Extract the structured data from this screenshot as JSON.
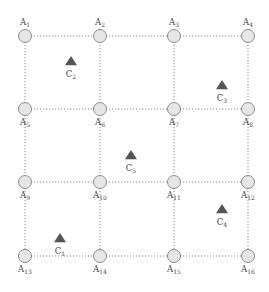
{
  "diagram": {
    "type": "grid-network",
    "grid": {
      "columns": 4,
      "rows": 4,
      "x": [
        25,
        100,
        174,
        248
      ],
      "y": [
        36,
        109,
        182,
        256
      ],
      "node_radius": 6.5
    },
    "colors": {
      "node_fill": "#e6e6e6",
      "node_stroke": "#8c8c8c",
      "edge": "#8a8a8a",
      "marker": "#555555",
      "label": "#444444"
    },
    "nodes": [
      {
        "id": "A1",
        "base": "A",
        "sub": "1",
        "col": 0,
        "row": 0,
        "label_pos": "above"
      },
      {
        "id": "A2",
        "base": "A",
        "sub": "2",
        "col": 1,
        "row": 0,
        "label_pos": "above"
      },
      {
        "id": "A3",
        "base": "A",
        "sub": "3",
        "col": 2,
        "row": 0,
        "label_pos": "above"
      },
      {
        "id": "A4",
        "base": "A",
        "sub": "4",
        "col": 3,
        "row": 0,
        "label_pos": "above"
      },
      {
        "id": "A5",
        "base": "A",
        "sub": "5",
        "col": 0,
        "row": 1,
        "label_pos": "below"
      },
      {
        "id": "A6",
        "base": "A",
        "sub": "6",
        "col": 1,
        "row": 1,
        "label_pos": "below"
      },
      {
        "id": "A7",
        "base": "A",
        "sub": "7",
        "col": 2,
        "row": 1,
        "label_pos": "below"
      },
      {
        "id": "A8",
        "base": "A",
        "sub": "8",
        "col": 3,
        "row": 1,
        "label_pos": "below"
      },
      {
        "id": "A9",
        "base": "A",
        "sub": "9",
        "col": 0,
        "row": 2,
        "label_pos": "below"
      },
      {
        "id": "A10",
        "base": "A",
        "sub": "10",
        "col": 1,
        "row": 2,
        "label_pos": "below"
      },
      {
        "id": "A11",
        "base": "A",
        "sub": "11",
        "col": 2,
        "row": 2,
        "label_pos": "below"
      },
      {
        "id": "A12",
        "base": "A",
        "sub": "12",
        "col": 3,
        "row": 2,
        "label_pos": "below"
      },
      {
        "id": "A13",
        "base": "A",
        "sub": "13",
        "col": 0,
        "row": 3,
        "label_pos": "below"
      },
      {
        "id": "A14",
        "base": "A",
        "sub": "14",
        "col": 1,
        "row": 3,
        "label_pos": "below"
      },
      {
        "id": "A15",
        "base": "A",
        "sub": "15",
        "col": 2,
        "row": 3,
        "label_pos": "below"
      },
      {
        "id": "A16",
        "base": "A",
        "sub": "16",
        "col": 3,
        "row": 3,
        "label_pos": "below"
      }
    ],
    "markers": [
      {
        "id": "C1",
        "base": "C",
        "sub": "1",
        "x": 60,
        "y": 239
      },
      {
        "id": "C2",
        "base": "C",
        "sub": "2",
        "x": 71,
        "y": 62
      },
      {
        "id": "C3",
        "base": "C",
        "sub": "3",
        "x": 222,
        "y": 86
      },
      {
        "id": "C4",
        "base": "C",
        "sub": "4",
        "x": 222,
        "y": 210
      },
      {
        "id": "C5",
        "base": "C",
        "sub": "5",
        "x": 131,
        "y": 156
      }
    ]
  }
}
